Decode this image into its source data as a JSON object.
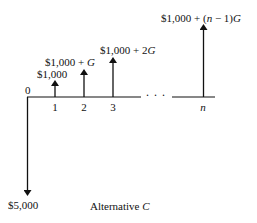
{
  "diagram": {
    "type": "cash-flow-diagram",
    "caption_prefix": "Alternative",
    "caption_var": "C",
    "origin_label": "0",
    "period_labels": [
      "1",
      "2",
      "3",
      "n"
    ],
    "ellipsis": ". . .",
    "investment": {
      "period": "0",
      "direction": "down",
      "label": "$5,000"
    },
    "receipts": [
      {
        "period": "1",
        "label_base": "$1,000",
        "label_tail": "",
        "direction": "up"
      },
      {
        "period": "2",
        "label_base": "$1,000 +",
        "label_tail": "G",
        "direction": "up"
      },
      {
        "period": "3",
        "label_base": "$1,000 + 2",
        "label_tail": "G",
        "direction": "up"
      },
      {
        "period": "n",
        "label_base": "$1,000 + (",
        "label_var": "n",
        "label_mid": " − 1)",
        "label_tail": "G",
        "direction": "up"
      }
    ],
    "colors": {
      "line": "#111111",
      "background": "#ffffff"
    }
  }
}
